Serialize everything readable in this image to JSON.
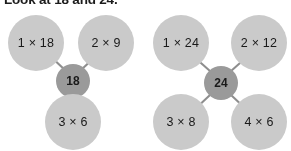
{
  "heading": "Look at 18 and 24.",
  "colors": {
    "factor_circle": "#cacaca",
    "product_circle": "#9a9a9a",
    "connector_line": "#8e8e8e",
    "text": "#1a1a1a",
    "background": "#ffffff"
  },
  "diagrams": [
    {
      "id": "18",
      "product": "18",
      "factor_count": 3,
      "factors": [
        {
          "label": "1 × 18",
          "position": "top-left"
        },
        {
          "label": "2 × 9",
          "position": "top-right"
        },
        {
          "label": "3 × 6",
          "position": "bottom-center"
        }
      ]
    },
    {
      "id": "24",
      "product": "24",
      "factor_count": 4,
      "factors": [
        {
          "label": "1 × 24",
          "position": "top-left"
        },
        {
          "label": "2 × 12",
          "position": "top-right"
        },
        {
          "label": "3 × 8",
          "position": "bottom-left"
        },
        {
          "label": "4 × 6",
          "position": "bottom-right"
        }
      ]
    }
  ]
}
